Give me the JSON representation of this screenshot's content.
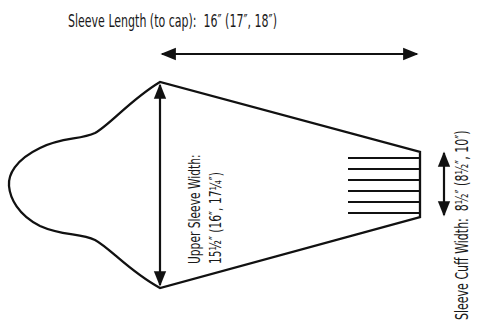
{
  "diagram": {
    "sleeve_length": {
      "label": "Sleeve Length (to cap):",
      "values": "16″ (17″, 18″)"
    },
    "upper_sleeve_width": {
      "label": "Upper Sleeve Width:",
      "values": "15½″ (16″, 17¼″)"
    },
    "sleeve_cuff_width": {
      "label": "Sleeve Cuff Width:",
      "values": "8½″ (8½″, 10″)"
    },
    "colors": {
      "stroke": "#111111",
      "text": "#1a1a1a",
      "background": "#ffffff"
    }
  }
}
